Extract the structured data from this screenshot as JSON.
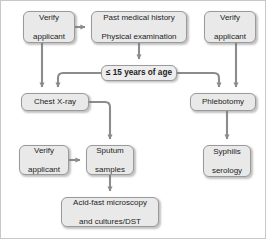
{
  "diagram": {
    "style": {
      "node_fill": "#e9e9e9",
      "node_border": "#9a9a9a",
      "connector_color": "#8c8c8c",
      "text_color": "#1d1d1d",
      "background": "#ffffff",
      "frame_border": "#c8c8c8"
    },
    "nodes": [
      {
        "id": "verify_left_top",
        "label": "Verify\napplicant",
        "line1": "Verify",
        "line2": "applicant",
        "x": 22,
        "y": 10,
        "w": 52,
        "h": 32,
        "emphasis": false
      },
      {
        "id": "past_medical",
        "label": "Past medical history\nPhysical examination",
        "line1": "Past medical history",
        "line2": "Physical examination",
        "x": 90,
        "y": 10,
        "w": 96,
        "h": 32,
        "emphasis": false
      },
      {
        "id": "verify_right_top",
        "label": "Verify\napplicant",
        "line1": "Verify",
        "line2": "applicant",
        "x": 203,
        "y": 10,
        "w": 52,
        "h": 32,
        "emphasis": false
      },
      {
        "id": "age_gate",
        "label": "≤ 15 years of age",
        "line1": "≤ 15 years of age",
        "line2": "",
        "x": 100,
        "y": 64,
        "w": 76,
        "h": 16,
        "emphasis": true
      },
      {
        "id": "chest_xray",
        "label": "Chest X-ray",
        "line1": "Chest X-ray",
        "line2": "",
        "x": 20,
        "y": 92,
        "w": 68,
        "h": 18,
        "emphasis": false
      },
      {
        "id": "phlebotomy",
        "label": "Phlebotomy",
        "line1": "Phlebotomy",
        "line2": "",
        "x": 189,
        "y": 92,
        "w": 66,
        "h": 18,
        "emphasis": false
      },
      {
        "id": "verify_sputum",
        "label": "Verify\napplicant",
        "line1": "Verify",
        "line2": "applicant",
        "x": 18,
        "y": 144,
        "w": 50,
        "h": 30,
        "emphasis": false
      },
      {
        "id": "sputum_samples",
        "label": "Sputum\nsamples",
        "line1": "Sputum",
        "line2": "samples",
        "x": 85,
        "y": 144,
        "w": 48,
        "h": 30,
        "emphasis": false
      },
      {
        "id": "syphilis",
        "label": "Syphilis\nserology",
        "line1": "Syphilis",
        "line2": "serology",
        "x": 202,
        "y": 144,
        "w": 48,
        "h": 32,
        "emphasis": false
      },
      {
        "id": "acid_fast",
        "label": "Acid-fast microscopy\nand cultures/DST",
        "line1": "Acid-fast microscopy",
        "line2": "and cultures/DST",
        "x": 60,
        "y": 196,
        "w": 98,
        "h": 30,
        "emphasis": false
      }
    ],
    "connectors": [
      {
        "id": "verify-left-to-past-medical",
        "from": "verify_left_top",
        "to": "past_medical",
        "kind": "horizontal-arrow"
      },
      {
        "id": "past-medical-to-age-gate",
        "from": "past_medical",
        "to": "age_gate",
        "kind": "vertical-arrow"
      },
      {
        "id": "verify-left-to-chest-xray",
        "from": "verify_left_top",
        "to": "chest_xray",
        "kind": "vertical-arrow"
      },
      {
        "id": "age-gate-to-chest-xray",
        "from": "age_gate",
        "to": "chest_xray",
        "kind": "elbow-left-arrow"
      },
      {
        "id": "age-gate-to-phlebotomy",
        "from": "age_gate",
        "to": "phlebotomy",
        "kind": "elbow-right-arrow"
      },
      {
        "id": "verify-right-to-phlebotomy",
        "from": "verify_right_top",
        "to": "phlebotomy",
        "kind": "vertical-arrow"
      },
      {
        "id": "chest-xray-to-sputum",
        "from": "chest_xray",
        "to": "sputum_samples",
        "kind": "elbow-down-arrow"
      },
      {
        "id": "verify-sputum-to-sputum",
        "from": "verify_sputum",
        "to": "sputum_samples",
        "kind": "horizontal-arrow"
      },
      {
        "id": "sputum-to-acid-fast",
        "from": "sputum_samples",
        "to": "acid_fast",
        "kind": "vertical-arrow"
      },
      {
        "id": "phlebotomy-to-syphilis",
        "from": "phlebotomy",
        "to": "syphilis",
        "kind": "vertical-arrow"
      }
    ]
  }
}
